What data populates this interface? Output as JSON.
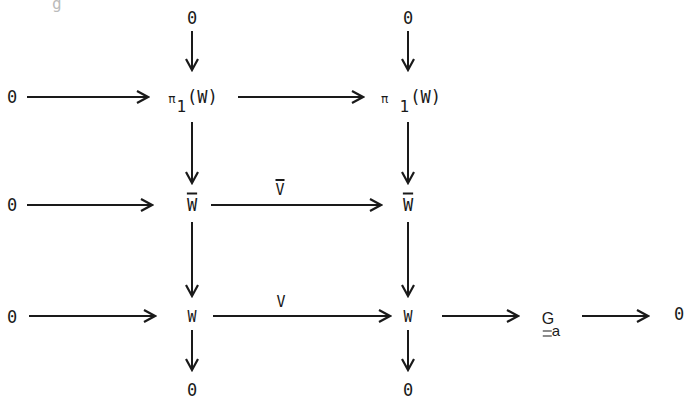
{
  "diagram": {
    "title": "",
    "top_cutoff_glyph": "g",
    "nodes": {
      "top_zero_1": "0",
      "top_zero_2": "0",
      "row1_left_zero": "0",
      "pi1_w_left": {
        "pi": "π",
        "sub": "1",
        "arg": "(W)"
      },
      "pi1_w_right": {
        "pi": "π",
        "sub": "1",
        "arg": "(W)"
      },
      "row2_left_zero": "0",
      "wbar_left": "W",
      "wbar_right": "W",
      "row3_left_zero": "0",
      "w_left": "W",
      "w_right": "W",
      "ga": {
        "base": "G",
        "sub": "a"
      },
      "row3_right_zero": "0",
      "bottom_zero_1": "0",
      "bottom_zero_2": "0"
    },
    "edge_labels": {
      "vbar": "V",
      "v": "V"
    },
    "edges": [
      {
        "from": "top_zero_1",
        "to": "pi1_w_left"
      },
      {
        "from": "top_zero_2",
        "to": "pi1_w_right"
      },
      {
        "from": "row1_left_zero",
        "to": "pi1_w_left"
      },
      {
        "from": "pi1_w_left",
        "to": "pi1_w_right"
      },
      {
        "from": "pi1_w_left",
        "to": "wbar_left"
      },
      {
        "from": "pi1_w_right",
        "to": "wbar_right"
      },
      {
        "from": "row2_left_zero",
        "to": "wbar_left"
      },
      {
        "from": "wbar_left",
        "to": "wbar_right",
        "label": "V̄"
      },
      {
        "from": "wbar_left",
        "to": "w_left"
      },
      {
        "from": "wbar_right",
        "to": "w_right"
      },
      {
        "from": "row3_left_zero",
        "to": "w_left"
      },
      {
        "from": "w_left",
        "to": "w_right",
        "label": "V"
      },
      {
        "from": "w_right",
        "to": "ga"
      },
      {
        "from": "ga",
        "to": "row3_right_zero"
      },
      {
        "from": "w_left",
        "to": "bottom_zero_1"
      },
      {
        "from": "w_right",
        "to": "bottom_zero_2"
      }
    ],
    "stroke_color": "#1a1a1a",
    "background": "#ffffff"
  }
}
